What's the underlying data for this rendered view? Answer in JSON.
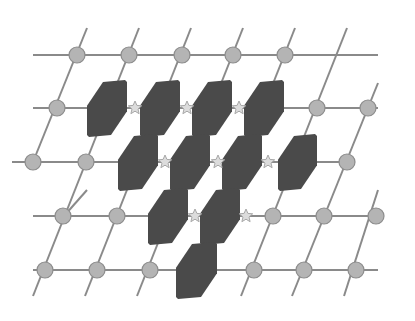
{
  "diagram": {
    "type": "lattice-with-blocks",
    "colors": {
      "background": "#ffffff",
      "line": "#8a8a8a",
      "node_fill": "#b4b4b4",
      "node_stroke": "#8c8c8c",
      "star_fill": "#dcdcdc",
      "star_stroke": "#a8a8a8",
      "block_fill": "#4a4a4a"
    },
    "horizontal_lines": [
      {
        "y": 55,
        "x1": 33,
        "x2": 378
      },
      {
        "y": 108,
        "x1": 33,
        "x2": 378
      },
      {
        "y": 162,
        "x1": 12,
        "x2": 355
      },
      {
        "y": 216,
        "x1": 33,
        "x2": 378
      },
      {
        "y": 270,
        "x1": 33,
        "x2": 378
      }
    ],
    "slant_lines": [
      {
        "x1": 87,
        "y1": 28,
        "x2": 33,
        "y2": 162
      },
      {
        "x1": 139,
        "y1": 28,
        "x2": 33,
        "y2": 296
      },
      {
        "x1": 191,
        "y1": 28,
        "x2": 85,
        "y2": 296
      },
      {
        "x1": 243,
        "y1": 28,
        "x2": 137,
        "y2": 296
      },
      {
        "x1": 295,
        "y1": 28,
        "x2": 189,
        "y2": 296
      },
      {
        "x1": 347,
        "y1": 28,
        "x2": 241,
        "y2": 296
      },
      {
        "x1": 378,
        "y1": 83,
        "x2": 292,
        "y2": 296
      },
      {
        "x1": 378,
        "y1": 190,
        "x2": 344,
        "y2": 296
      },
      {
        "x1": 87,
        "y1": 190,
        "x2": 64,
        "y2": 216
      }
    ],
    "nodes": [
      {
        "x": 77,
        "y": 55
      },
      {
        "x": 129,
        "y": 55
      },
      {
        "x": 182,
        "y": 55
      },
      {
        "x": 233,
        "y": 55
      },
      {
        "x": 285,
        "y": 55
      },
      {
        "x": 57,
        "y": 108
      },
      {
        "x": 317,
        "y": 108
      },
      {
        "x": 368,
        "y": 108
      },
      {
        "x": 33,
        "y": 162
      },
      {
        "x": 86,
        "y": 162
      },
      {
        "x": 347,
        "y": 162
      },
      {
        "x": 63,
        "y": 216
      },
      {
        "x": 117,
        "y": 216
      },
      {
        "x": 273,
        "y": 216
      },
      {
        "x": 324,
        "y": 216
      },
      {
        "x": 376,
        "y": 216
      },
      {
        "x": 45,
        "y": 270
      },
      {
        "x": 97,
        "y": 270
      },
      {
        "x": 150,
        "y": 270
      },
      {
        "x": 254,
        "y": 270
      },
      {
        "x": 304,
        "y": 270
      },
      {
        "x": 356,
        "y": 270
      }
    ],
    "stars": [
      {
        "x": 135,
        "y": 108
      },
      {
        "x": 187,
        "y": 108
      },
      {
        "x": 239,
        "y": 108
      },
      {
        "x": 165,
        "y": 162
      },
      {
        "x": 218,
        "y": 162
      },
      {
        "x": 268,
        "y": 162
      },
      {
        "x": 195,
        "y": 216
      },
      {
        "x": 246,
        "y": 216
      }
    ],
    "blocks": [
      {
        "x": 87,
        "y": 80,
        "w": 40,
        "h": 57
      },
      {
        "x": 140,
        "y": 80,
        "w": 40,
        "h": 57
      },
      {
        "x": 192,
        "y": 80,
        "w": 40,
        "h": 57
      },
      {
        "x": 244,
        "y": 80,
        "w": 40,
        "h": 57
      },
      {
        "x": 118,
        "y": 134,
        "w": 40,
        "h": 57
      },
      {
        "x": 170,
        "y": 134,
        "w": 40,
        "h": 57
      },
      {
        "x": 222,
        "y": 134,
        "w": 40,
        "h": 57
      },
      {
        "x": 278,
        "y": 134,
        "w": 39,
        "h": 57
      },
      {
        "x": 148,
        "y": 188,
        "w": 40,
        "h": 57
      },
      {
        "x": 200,
        "y": 188,
        "w": 40,
        "h": 57
      },
      {
        "x": 176,
        "y": 242,
        "w": 41,
        "h": 57
      }
    ]
  }
}
